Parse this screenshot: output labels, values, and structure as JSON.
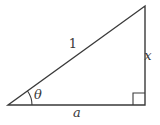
{
  "diagram": {
    "labels": {
      "hypotenuse": "1",
      "vertical_side": "x",
      "base_side": "a",
      "angle": "θ"
    },
    "colors": {
      "line": "#3a3a3a",
      "background": "#ffffff"
    }
  }
}
